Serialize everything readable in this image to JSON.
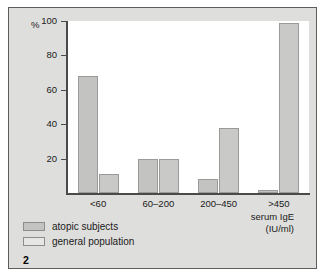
{
  "figure": {
    "number": "2",
    "percent_symbol": "%"
  },
  "legend": {
    "items": [
      {
        "label": "atopic subjects",
        "key": "atopic",
        "color": "#c3c3c1"
      },
      {
        "label": "general population",
        "key": "general",
        "color": "#e6e6e4"
      }
    ]
  },
  "axis_title": {
    "line1": "serum IgE",
    "line2": "(IU/ml)"
  },
  "chart_data": {
    "type": "bar",
    "title": "",
    "subtitle": "",
    "xlabel": "serum IgE (IU/ml)",
    "ylabel": "%",
    "ylim": [
      0,
      100
    ],
    "yticks": [
      100,
      80,
      60,
      40,
      20
    ],
    "grid": false,
    "legend_position": "bottom-left",
    "categories": [
      "<60",
      "60–200",
      "200–450",
      ">450"
    ],
    "series": [
      {
        "name": "atopic subjects",
        "color": "#c3c3c1",
        "values": [
          68,
          20,
          8,
          2
        ]
      },
      {
        "name": "general population",
        "color": "#c9c9c7",
        "values": [
          11,
          20,
          38,
          99
        ]
      }
    ]
  }
}
